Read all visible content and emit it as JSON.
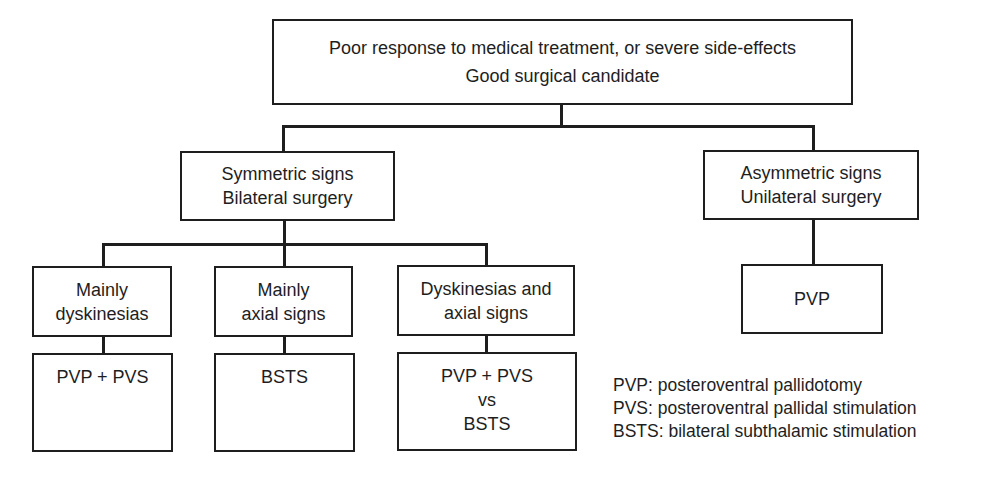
{
  "root": {
    "line1": "Poor response to medical treatment, or severe side-effects",
    "line2": "Good surgical candidate"
  },
  "branches": {
    "symmetric": {
      "line1": "Symmetric signs",
      "line2": "Bilateral surgery"
    },
    "asymmetric": {
      "line1": "Asymmetric signs",
      "line2": "Unilateral surgery"
    }
  },
  "symmetric_children": [
    {
      "line1": "Mainly",
      "line2": "dyskinesias",
      "result": [
        "PVP + PVS"
      ]
    },
    {
      "line1": "Mainly",
      "line2": "axial signs",
      "result": [
        "BSTS"
      ]
    },
    {
      "line1": "Dyskinesias and",
      "line2": "axial signs",
      "result": [
        "PVP + PVS",
        "vs",
        "BSTS"
      ]
    }
  ],
  "asymmetric_result": "PVP",
  "legend": [
    "PVP: posteroventral pallidotomy",
    "PVS: posteroventral pallidal stimulation",
    "BSTS: bilateral subthalamic stimulation"
  ]
}
